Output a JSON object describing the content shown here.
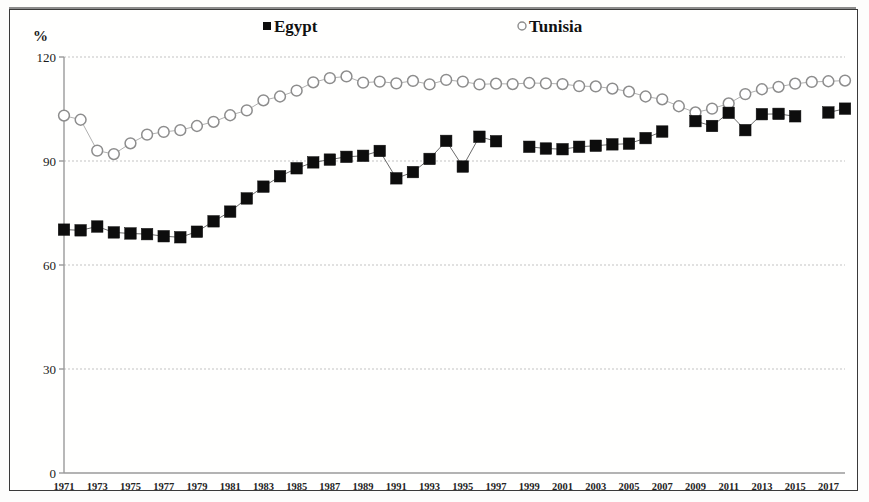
{
  "chart_data": {
    "type": "line",
    "title": "",
    "subtitle": "",
    "xlabel": "",
    "ylabel": "%",
    "ylim": [
      0,
      120
    ],
    "xlim": [
      1971,
      2018
    ],
    "yticks": [
      0,
      30,
      60,
      90,
      120
    ],
    "xticks": [
      1971,
      1973,
      1975,
      1977,
      1979,
      1981,
      1983,
      1985,
      1987,
      1989,
      1991,
      1993,
      1995,
      1997,
      1999,
      2001,
      2003,
      2005,
      2007,
      2009,
      2011,
      2013,
      2015,
      2017
    ],
    "grid": true,
    "legend_position": "top",
    "x": [
      1971,
      1972,
      1973,
      1974,
      1975,
      1976,
      1977,
      1978,
      1979,
      1980,
      1981,
      1982,
      1983,
      1984,
      1985,
      1986,
      1987,
      1988,
      1989,
      1990,
      1991,
      1992,
      1993,
      1994,
      1995,
      1996,
      1997,
      1998,
      1999,
      2000,
      2001,
      2002,
      2003,
      2004,
      2005,
      2006,
      2007,
      2008,
      2009,
      2010,
      2011,
      2012,
      2013,
      2014,
      2015,
      2016,
      2017,
      2018
    ],
    "series": [
      {
        "name": "Egypt",
        "marker": "filled-square",
        "color": "#0d0d0d",
        "values": [
          70.2,
          70.0,
          71.1,
          69.4,
          69.1,
          68.9,
          68.3,
          68.0,
          69.6,
          72.6,
          75.4,
          79.2,
          82.6,
          85.6,
          87.9,
          89.6,
          90.4,
          91.2,
          91.5,
          92.9,
          85.0,
          86.8,
          90.6,
          95.8,
          88.4,
          97.0,
          95.7,
          null,
          94.1,
          93.6,
          93.4,
          94.1,
          94.4,
          94.8,
          95.0,
          96.6,
          98.5,
          null,
          101.5,
          100.1,
          103.9,
          98.9,
          103.5,
          103.6,
          102.9,
          null,
          104.0,
          105.1
        ]
      },
      {
        "name": "Tunisia",
        "marker": "open-circle",
        "color": "#8d8d8d",
        "values": [
          103.1,
          101.9,
          93.0,
          92.0,
          95.1,
          97.6,
          98.4,
          98.9,
          100.1,
          101.3,
          103.2,
          104.6,
          107.5,
          108.6,
          110.3,
          112.7,
          113.9,
          114.4,
          112.6,
          112.9,
          112.4,
          113.1,
          112.1,
          113.4,
          112.9,
          112.1,
          112.3,
          112.2,
          112.5,
          112.4,
          112.2,
          111.6,
          111.5,
          110.9,
          110.0,
          108.6,
          107.8,
          105.8,
          104.0,
          105.1,
          106.6,
          109.3,
          110.7,
          111.4,
          112.3,
          112.8,
          113.0,
          113.2
        ]
      }
    ]
  },
  "axis": {
    "y_unit_label": "%",
    "y_tick_labels": [
      "120",
      "90",
      "60",
      "30",
      "0"
    ],
    "x_tick_labels": [
      "1971",
      "1973",
      "1975",
      "1977",
      "1979",
      "1981",
      "1983",
      "1985",
      "1987",
      "1989",
      "1991",
      "1993",
      "1995",
      "1997",
      "1999",
      "2001",
      "2003",
      "2005",
      "2007",
      "2009",
      "2011",
      "2013",
      "2015",
      "2017"
    ]
  },
  "legend": {
    "items": [
      {
        "label": "Egypt",
        "marker": "filled-square",
        "color": "#0d0d0d"
      },
      {
        "label": "Tunisia",
        "marker": "open-circle",
        "color": "#8d8d8d"
      }
    ]
  },
  "colors": {
    "egypt_marker": "#0d0d0d",
    "tunisia_marker": "#8d8d8d",
    "gridline": "#b9b9b9",
    "axis": "#9a9a9a",
    "frame": "#3a3a3a"
  }
}
